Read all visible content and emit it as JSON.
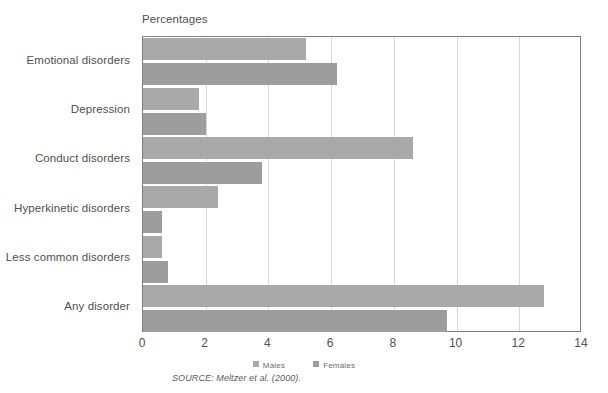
{
  "figure": {
    "axis_caption": "Percentages",
    "source_note": "SOURCE: Meltzer et al. (2000)."
  },
  "legend": {
    "position": "bottom-center",
    "items": [
      {
        "label": "Males",
        "color": "#a9a9a9",
        "swatch_name": "legend-swatch-males"
      },
      {
        "label": "Females",
        "color": "#9d9d9d",
        "swatch_name": "legend-swatch-females"
      }
    ]
  },
  "axis": {
    "ticks": [
      {
        "label": "0",
        "value": 0
      },
      {
        "label": "2",
        "value": 2
      },
      {
        "label": "4",
        "value": 4
      },
      {
        "label": "6",
        "value": 6
      },
      {
        "label": "8",
        "value": 8
      },
      {
        "label": "10",
        "value": 10
      },
      {
        "label": "12",
        "value": 12
      },
      {
        "label": "14",
        "value": 14
      }
    ]
  },
  "chart_data": {
    "type": "bar",
    "orientation": "horizontal",
    "title": "",
    "subtitle": "",
    "xlabel": "Percentages",
    "ylabel": "",
    "xlim": [
      0,
      14
    ],
    "xticks": [
      0,
      2,
      4,
      6,
      8,
      10,
      12,
      14
    ],
    "grid": "vertical",
    "legend_position": "bottom-center",
    "annotations": [
      "SOURCE: Meltzer et al. (2000)."
    ],
    "categories": [
      "Emotional disorders",
      "Depression",
      "Conduct disorders",
      "Hyperkinetic disorders",
      "Less common disorders",
      "Any disorder"
    ],
    "series": [
      {
        "name": "Males",
        "color": "#a9a9a9",
        "values": [
          5.2,
          1.8,
          8.6,
          2.4,
          0.6,
          12.8
        ]
      },
      {
        "name": "Females",
        "color": "#9d9d9d",
        "values": [
          6.2,
          2.0,
          3.8,
          0.6,
          0.8,
          9.7
        ]
      }
    ]
  }
}
